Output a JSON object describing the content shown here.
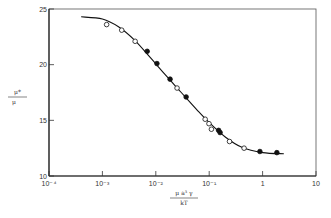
{
  "chart_data": {
    "type": "scatter",
    "title": "",
    "xlabel": "μ a³ γ / kT",
    "ylabel": "μ* / μ",
    "xscale": "log",
    "xlim": [
      0.0001,
      10
    ],
    "ylim": [
      10,
      25
    ],
    "grid": false,
    "legend": null,
    "x_ticks": [
      "10⁻⁴",
      "10⁻³",
      "10⁻²",
      "10⁻¹",
      "1",
      "10"
    ],
    "y_ticks": [
      "10",
      "15",
      "20",
      "25"
    ],
    "series": [
      {
        "name": "open circles",
        "marker": "open-circle",
        "points": [
          {
            "x": 0.0012,
            "y": 23.6
          },
          {
            "x": 0.0023,
            "y": 23.1
          },
          {
            "x": 0.0041,
            "y": 22.1
          },
          {
            "x": 0.025,
            "y": 17.9
          },
          {
            "x": 0.084,
            "y": 15.1
          },
          {
            "x": 0.099,
            "y": 14.7
          },
          {
            "x": 0.11,
            "y": 14.2
          },
          {
            "x": 0.24,
            "y": 13.1
          },
          {
            "x": 0.45,
            "y": 12.5
          }
        ]
      },
      {
        "name": "filled circles",
        "marker": "filled-circle",
        "points": [
          {
            "x": 0.0069,
            "y": 21.2
          },
          {
            "x": 0.0105,
            "y": 20.1
          },
          {
            "x": 0.0185,
            "y": 18.7
          },
          {
            "x": 0.037,
            "y": 17.1
          },
          {
            "x": 0.15,
            "y": 14.1
          },
          {
            "x": 0.16,
            "y": 13.9
          },
          {
            "x": 0.89,
            "y": 12.2
          },
          {
            "x": 1.85,
            "y": 12.1
          }
        ]
      },
      {
        "name": "fitted curve",
        "marker": "line",
        "points": [
          {
            "x": 0.0004,
            "y": 24.3
          },
          {
            "x": 0.001,
            "y": 24.1
          },
          {
            "x": 0.002,
            "y": 23.4
          },
          {
            "x": 0.004,
            "y": 22.2
          },
          {
            "x": 0.008,
            "y": 20.6
          },
          {
            "x": 0.015,
            "y": 19.1
          },
          {
            "x": 0.03,
            "y": 17.5
          },
          {
            "x": 0.06,
            "y": 15.9
          },
          {
            "x": 0.1,
            "y": 14.8
          },
          {
            "x": 0.2,
            "y": 13.5
          },
          {
            "x": 0.4,
            "y": 12.6
          },
          {
            "x": 1,
            "y": 12.1
          },
          {
            "x": 2.5,
            "y": 12.0
          }
        ]
      }
    ]
  },
  "axes": {
    "y_label_num": "μ*",
    "y_label_den": "μ",
    "x_label_num": "μ a³ γ",
    "x_label_den": "kT"
  }
}
